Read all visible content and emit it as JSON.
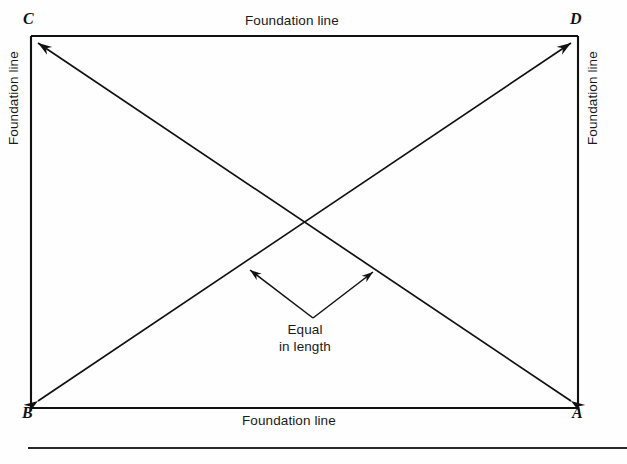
{
  "figure": {
    "type": "construction-layout-diagram",
    "background_color": "#fefefe",
    "line_color": "#111111",
    "text_color": "#1a1a1a"
  },
  "rectangle": {
    "corners": {
      "top_left": {
        "label": "C",
        "x": 31,
        "y": 36
      },
      "top_right": {
        "label": "D",
        "x": 578,
        "y": 36
      },
      "bottom_left": {
        "label": "B",
        "x": 31,
        "y": 408
      },
      "bottom_right": {
        "label": "A",
        "x": 578,
        "y": 408
      }
    }
  },
  "edge_labels": {
    "top": "Foundation line",
    "right": "Foundation line",
    "bottom": "Foundation line",
    "left": "Foundation line"
  },
  "diagonals": [
    {
      "name": "diagonal-B-D",
      "from": "B",
      "to": "D",
      "arrowheads": "both"
    },
    {
      "name": "diagonal-A-C",
      "from": "A",
      "to": "C",
      "arrowheads": "both"
    }
  ],
  "intersection": {
    "x": 310,
    "y": 222
  },
  "annotation": {
    "line1": "Equal",
    "line2": "in length",
    "vertex": {
      "x": 313,
      "y": 318
    },
    "arrow_tips": [
      {
        "x": 248,
        "y": 268
      },
      {
        "x": 375,
        "y": 270
      }
    ]
  },
  "footer_rule": {
    "x1": 28,
    "x2": 627,
    "y": 448
  }
}
